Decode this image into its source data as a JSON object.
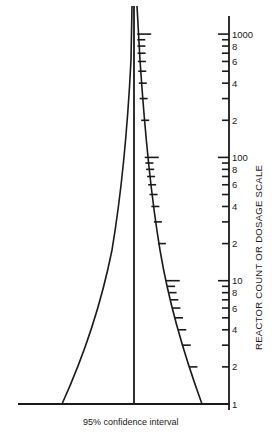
{
  "diagram": {
    "type": "funnel-confidence-interval",
    "caption": "95% confidence interval",
    "axis_title": "REACTOR COUNT OR DOSAGE SCALE",
    "axis_scale": "log",
    "axis_range": [
      1,
      1000
    ],
    "decade_labels": [
      "1",
      "10",
      "100",
      "1000"
    ],
    "minor_labels_per_decade": [
      "2",
      "4",
      "6",
      "8"
    ],
    "tick_values": [
      1,
      2,
      3,
      4,
      5,
      6,
      7,
      8,
      9,
      10,
      20,
      30,
      40,
      50,
      60,
      70,
      80,
      90,
      100,
      200,
      300,
      400,
      500,
      600,
      700,
      800,
      900,
      1000
    ],
    "axis_labels": [
      {
        "value": 1,
        "text": "1"
      },
      {
        "value": 2,
        "text": "2"
      },
      {
        "value": 4,
        "text": "4"
      },
      {
        "value": 6,
        "text": "6"
      },
      {
        "value": 8,
        "text": "8"
      },
      {
        "value": 10,
        "text": "10"
      },
      {
        "value": 20,
        "text": "2"
      },
      {
        "value": 40,
        "text": "4"
      },
      {
        "value": 60,
        "text": "6"
      },
      {
        "value": 80,
        "text": "8"
      },
      {
        "value": 100,
        "text": "100"
      },
      {
        "value": 200,
        "text": "2"
      },
      {
        "value": 400,
        "text": "4"
      },
      {
        "value": 600,
        "text": "6"
      },
      {
        "value": 800,
        "text": "8"
      },
      {
        "value": 1000,
        "text": "1000"
      }
    ],
    "elements": {
      "center_line": "vertical median line",
      "left_curve": "lower confidence bound",
      "right_curve": "upper confidence bound with scale ticks",
      "baseline": "horizontal base line"
    },
    "colors": {
      "ink": "#1a1a1a",
      "background": "#ffffff"
    }
  }
}
